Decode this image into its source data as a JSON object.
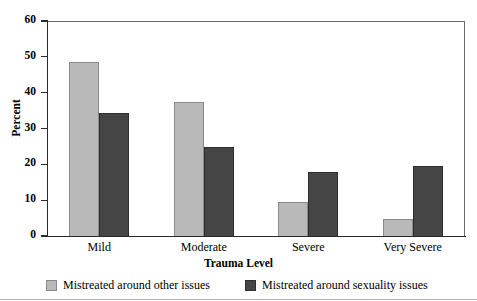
{
  "chart_data": {
    "type": "bar",
    "title": "",
    "xlabel": "Trauma Level",
    "ylabel": "Percent",
    "categories": [
      "Mild",
      "Moderate",
      "Severe",
      "Very Severe"
    ],
    "ylim": [
      0,
      60
    ],
    "yticks": [
      0,
      10,
      20,
      30,
      40,
      50,
      60
    ],
    "grid": false,
    "legend_position": "bottom",
    "series": [
      {
        "name": "Mistreated around other issues",
        "color": "#b9b9b9",
        "values": [
          48.5,
          37.5,
          9.5,
          4.7
        ]
      },
      {
        "name": "Mistreated around sexuality issues",
        "color": "#454545",
        "values": [
          34.3,
          24.8,
          17.9,
          19.4
        ]
      }
    ]
  },
  "axis": {
    "ylabel": "Percent",
    "xlabel": "Trauma Level",
    "ytick_labels": [
      "0",
      "10",
      "20",
      "30",
      "40",
      "50",
      "60"
    ],
    "xtick_labels": [
      "Mild",
      "Moderate",
      "Severe",
      "Very Severe"
    ]
  },
  "legend": {
    "items": [
      {
        "label": "Mistreated around other issues",
        "swatch": "light-gray-swatch"
      },
      {
        "label": "Mistreated around sexuality issues",
        "swatch": "dark-gray-swatch"
      }
    ]
  }
}
